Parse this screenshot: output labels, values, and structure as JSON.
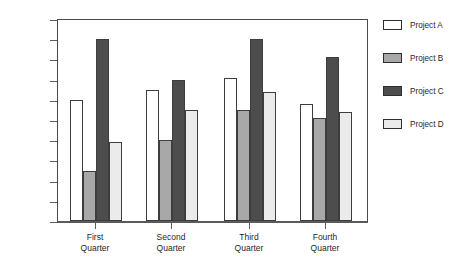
{
  "chart_data": {
    "type": "bar",
    "title": "",
    "subtitle": "",
    "xlabel": "",
    "ylabel": "",
    "categories": [
      "First Quarter",
      "Second Quarter",
      "Third Quarter",
      "Fourth Quarter"
    ],
    "category_lines": [
      [
        "First",
        "Quarter"
      ],
      [
        "Second",
        "Quarter"
      ],
      [
        "Third",
        "Quarter"
      ],
      [
        "Fourth",
        "Quarter"
      ]
    ],
    "series": [
      {
        "name": "Project A",
        "color": "#ffffff",
        "values": [
          300,
          325,
          355,
          290
        ]
      },
      {
        "name": "Project B",
        "color": "#a8a8a8",
        "values": [
          125,
          200,
          275,
          255
        ]
      },
      {
        "name": "Project C",
        "color": "#4d4d4d",
        "values": [
          450,
          350,
          450,
          405
        ]
      },
      {
        "name": "Project D",
        "color": "#ebebeb",
        "values": [
          195,
          275,
          320,
          270
        ]
      }
    ],
    "ylim": [
      0,
      500
    ],
    "yticks": [
      0,
      50,
      100,
      150,
      200,
      250,
      300,
      350,
      400,
      450,
      500
    ],
    "ytick_labels": [
      "0",
      "50",
      "100",
      "150",
      "200",
      "250",
      "300",
      "350",
      "400",
      "450",
      "500"
    ],
    "grid": false,
    "legend_position": "right",
    "legend_entries": [
      "Project A",
      "Project B",
      "Project C",
      "Project D"
    ],
    "bar_border_color": "#3d3d3d",
    "axis_color": "#4a4a4a",
    "background_color": "#ffffff"
  }
}
